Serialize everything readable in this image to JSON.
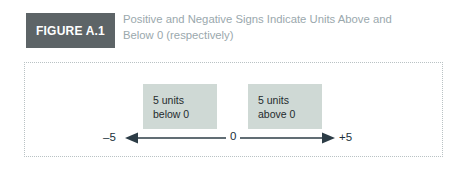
{
  "figure": {
    "badge_label": "FIGURE A.1",
    "caption_line1": "Positive and Negative Signs Indicate Units Above and",
    "caption_line2": "Below 0 (respectively)",
    "badge_bg": "#5d6467",
    "badge_text_color": "#ffffff",
    "caption_color": "#9aa8ad",
    "panel_border_color": "#b9c2c4"
  },
  "diagram": {
    "callout_below": {
      "line1": "5 units",
      "line2": "below 0"
    },
    "callout_above": {
      "line1": "5 units",
      "line2": "above 0"
    },
    "callout_bg": "#cfd9d5",
    "number_line": {
      "left_label": "–5",
      "center_label": "0",
      "right_label": "+5",
      "line_color": "#2c3c46",
      "left_arrow_icon": "arrow-left-icon",
      "right_arrow_icon": "arrow-right-icon"
    }
  }
}
